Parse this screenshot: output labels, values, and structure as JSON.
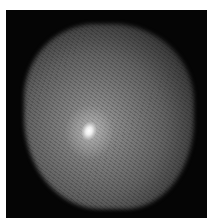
{
  "image": {
    "description": "Grayscale astronomical image of a diffuse grainy cloud with a bright compact core, on black background with white border",
    "colors": {
      "background": "#050505",
      "border": "#ffffff",
      "cloud": "#7d7d7d",
      "core": "#ffffff"
    }
  }
}
